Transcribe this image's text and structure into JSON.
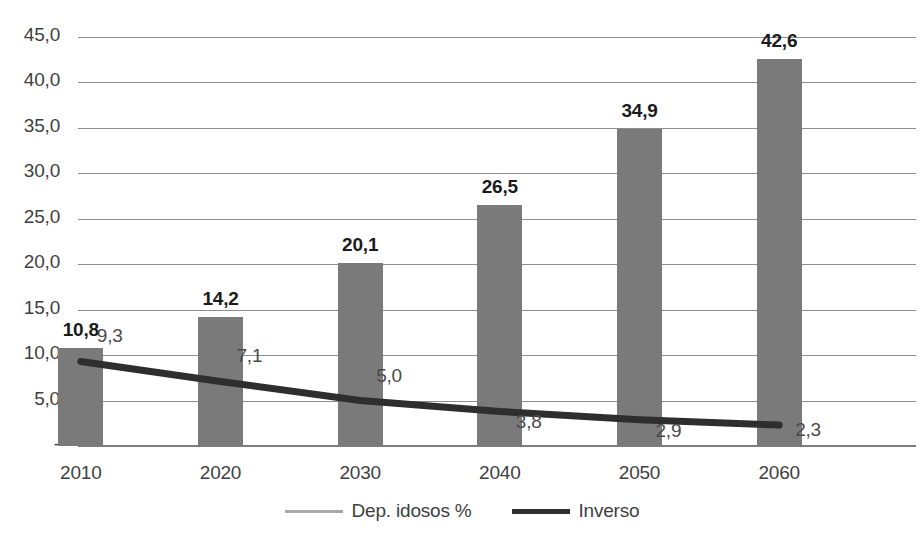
{
  "chart_data": {
    "type": "bar",
    "title": "",
    "subtitle": "",
    "xlabel": "",
    "ylabel": "",
    "categories": [
      "2010",
      "2020",
      "2030",
      "2040",
      "2050",
      "2060"
    ],
    "ylim": [
      0,
      45
    ],
    "grid": true,
    "legend_position": "bottom",
    "y_ticks": [
      {
        "value": 45,
        "label": "45,0"
      },
      {
        "value": 40,
        "label": "40,0"
      },
      {
        "value": 35,
        "label": "35,0"
      },
      {
        "value": 30,
        "label": "30,0"
      },
      {
        "value": 25,
        "label": "25,0"
      },
      {
        "value": 20,
        "label": "20,0"
      },
      {
        "value": 15,
        "label": "15,0"
      },
      {
        "value": 10,
        "label": "10,0"
      },
      {
        "value": 5,
        "label": "5,0"
      },
      {
        "value": 0,
        "label": "-"
      }
    ],
    "series": [
      {
        "name": "Dep. idosos %",
        "type": "bar",
        "color": "#7a7a7a",
        "values": [
          10.8,
          14.2,
          20.1,
          26.5,
          34.9,
          42.6
        ],
        "labels": [
          "10,8",
          "14,2",
          "20,1",
          "26,5",
          "34,9",
          "42,6"
        ]
      },
      {
        "name": "Inverso",
        "type": "line",
        "color": "#2e2e2e",
        "values": [
          9.3,
          7.1,
          5.0,
          3.8,
          2.9,
          2.3
        ],
        "labels": [
          "9,3",
          "7,1",
          "5,0",
          "3,8",
          "2,9",
          "2,3"
        ]
      }
    ]
  },
  "legend": {
    "items": [
      {
        "label": "Dep. idosos %",
        "marker": "thin-gray-line"
      },
      {
        "label": "Inverso",
        "marker": "thick-dark-line"
      }
    ]
  },
  "colors": {
    "bar_fill": "#7a7a7a",
    "line_stroke": "#2e2e2e",
    "gridline": "#8e8e8e",
    "axis_text": "#3f3f3f",
    "bar_label_text": "#1b1b1b",
    "line_label_text": "#4a4a4a",
    "background": "#ffffff"
  }
}
